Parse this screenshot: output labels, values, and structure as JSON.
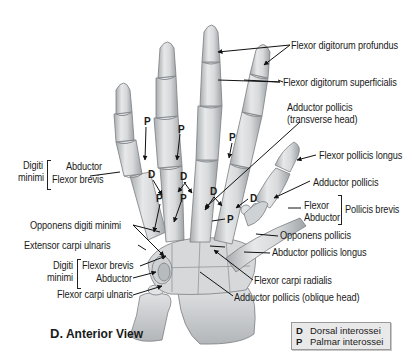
{
  "figure": {
    "view_title_letter": "D.",
    "view_title_text": "Anterior View"
  },
  "labels": {
    "flexor_digitorum_profundus": "Flexor digitorum profundus",
    "flexor_digitorum_superficialis": "Flexor digitorum superficialis",
    "adductor_pollicis_transverse_1": "Adductor pollicis",
    "adductor_pollicis_transverse_2": "(transverse head)",
    "flexor_pollicis_longus": "Flexor pollicis longus",
    "adductor_pollicis": "Adductor pollicis",
    "pollicis_flexor": "Flexor",
    "pollicis_abductor": "Abductor",
    "pollicis_brevis": "Pollicis brevis",
    "opponens_pollicis": "Opponens pollicis",
    "abductor_pollicis_longus": "Abductor pollicis longus",
    "flexor_carpi_radialis": "Flexor carpi radialis",
    "adductor_pollicis_oblique": "Adductor pollicis (oblique head)",
    "digiti_minimi_upper_1": "Digiti",
    "digiti_minimi_upper_2": "minimi",
    "dm_abductor_upper": "Abductor",
    "dm_flexor_brevis_upper": "Flexor brevis",
    "opponens_digiti_minimi": "Opponens digiti minimi",
    "extensor_carpi_ulnaris": "Extensor carpi ulnaris",
    "digiti_minimi_lower_1": "Digiti",
    "digiti_minimi_lower_2": "minimi",
    "dm_flexor_brevis_lower": "Flexor brevis",
    "dm_abductor_lower": "Abductor",
    "flexor_carpi_ulnaris": "Flexor carpi ulnaris"
  },
  "markers": {
    "D": "D",
    "P": "P"
  },
  "legend": {
    "items": [
      {
        "key": "D",
        "text": "Dorsal interossei"
      },
      {
        "key": "P",
        "text": "Palmar interossei"
      }
    ]
  },
  "colors": {
    "bone_fill": "#d4d6d8",
    "bone_highlight": "#eceeef",
    "bone_shadow": "#a6a9ac",
    "bone_outline": "#7b7f83",
    "muscle_attachment": "#9aa0a4",
    "leader_line": "#111111",
    "legend_bg": "#e9e9e9"
  }
}
